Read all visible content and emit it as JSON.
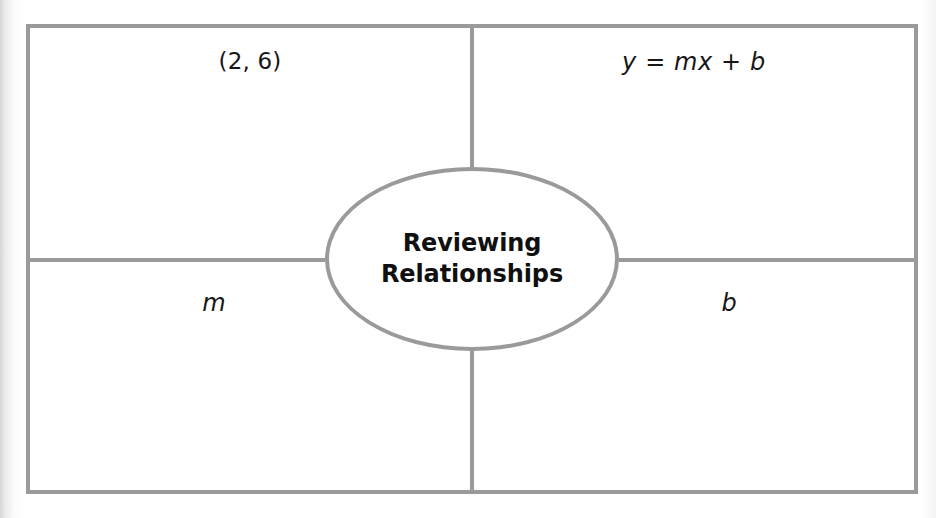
{
  "graphic_organizer": {
    "type": "four-quadrant concept web",
    "center": {
      "shape": "oval",
      "label": "Reviewing\nRelationships"
    },
    "quadrants": [
      {
        "position": "top-left",
        "label": "(2, 6)",
        "style": "upright"
      },
      {
        "position": "top-right",
        "label": "y = mx + b",
        "style": "italic"
      },
      {
        "position": "bottom-left",
        "label": "m",
        "style": "italic"
      },
      {
        "position": "bottom-right",
        "label": "b",
        "style": "italic"
      }
    ],
    "colors": {
      "line": "#9a9a9a",
      "text": "#171717",
      "background": "#ffffff"
    }
  }
}
